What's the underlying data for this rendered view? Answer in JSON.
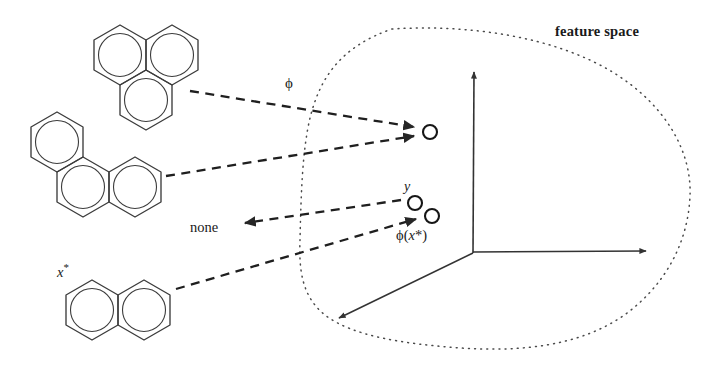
{
  "figure": {
    "type": "kernel-feature-space-diagram",
    "background_color": "#ffffff",
    "line_color": "#333333",
    "text_color": "#1a1a1a",
    "width": 718,
    "height": 365
  },
  "labels": {
    "feature_space": "feature space",
    "phi_map": "ϕ",
    "none": "none",
    "point_y": "y",
    "point_phi_xstar_prefix": "ϕ(",
    "point_phi_xstar_var": "x",
    "point_phi_xstar_star": "*",
    "point_phi_xstar_suffix": ")",
    "molecule_xstar_var": "x",
    "molecule_xstar_star": "*"
  },
  "molecules": [
    {
      "name": "phenalene",
      "ring_count": 3,
      "arrangement": "triangular-fused",
      "label": ""
    },
    {
      "name": "phenanthrene",
      "ring_count": 3,
      "arrangement": "angular-fused",
      "label": ""
    },
    {
      "name": "naphthalene",
      "ring_count": 2,
      "arrangement": "linear-fused",
      "label": "x*"
    }
  ],
  "feature_points": [
    {
      "id": "image-point-top",
      "label": "",
      "cx": 430,
      "cy": 132,
      "r": 7
    },
    {
      "id": "point-y",
      "label": "y",
      "cx": 415,
      "cy": 203,
      "r": 7
    },
    {
      "id": "point-phi-xstar",
      "label": "ϕ(x*)",
      "cx": 432,
      "cy": 216,
      "r": 7
    }
  ],
  "axes": {
    "origin": [
      473,
      253
    ],
    "vertical_tip": [
      474,
      67
    ],
    "horizontal_tip": [
      652,
      251
    ],
    "depth_tip": [
      333,
      323
    ]
  },
  "mappings": [
    {
      "from": "phenalene",
      "to": "image-point-top",
      "label": "ϕ",
      "style": "dashed-arrow"
    },
    {
      "from": "phenanthrene",
      "to": "image-point-top",
      "label": "",
      "style": "dashed-arrow"
    },
    {
      "from": "naphthalene",
      "to": "point-phi-xstar",
      "label": "",
      "style": "dashed-arrow"
    },
    {
      "from": "point-y",
      "to": "none",
      "label": "none",
      "style": "dashed-arrow-reverse"
    }
  ]
}
